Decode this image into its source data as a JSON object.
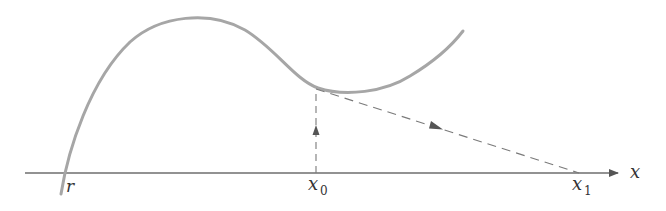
{
  "figure": {
    "colors": {
      "curve": "#a6a6a6",
      "axis": "#6e6e6e",
      "dashed": "#7a7a7a",
      "arrow": "#555555",
      "text": "#333333"
    }
  },
  "labels": {
    "axis_x": "x",
    "root": "r",
    "x0_base": "x",
    "x0_sub": "0",
    "x1_base": "x",
    "x1_sub": "1"
  }
}
